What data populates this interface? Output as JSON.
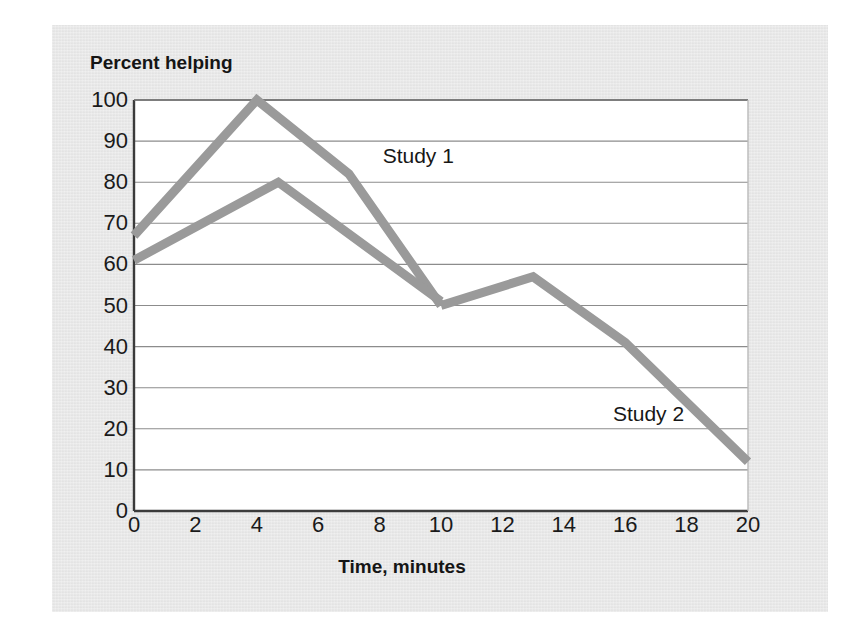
{
  "chart_data": {
    "type": "line",
    "title": "",
    "xlabel": "Time, minutes",
    "ylabel": "Percent helping",
    "xlim": [
      0,
      20
    ],
    "ylim": [
      0,
      100
    ],
    "xticks": [
      0,
      2,
      4,
      6,
      8,
      10,
      12,
      14,
      16,
      18,
      20
    ],
    "yticks": [
      0,
      10,
      20,
      30,
      40,
      50,
      60,
      70,
      80,
      90,
      100
    ],
    "grid": "horizontal",
    "legend_position": "inline-annotation",
    "line_color": "#9a9a9a",
    "line_width_px": 9,
    "series": [
      {
        "name": "Study 1",
        "label_x": 8.1,
        "label_y": 86,
        "x": [
          0,
          4,
          7,
          10
        ],
        "y": [
          67,
          100,
          82,
          50
        ]
      },
      {
        "name": "Study 2",
        "label_x": 15.6,
        "label_y": 23,
        "x": [
          0,
          4.7,
          10
        ],
        "y": [
          61,
          80,
          51
        ]
      },
      {
        "name": "Combined tail",
        "label_x": null,
        "label_y": null,
        "x": [
          10,
          13,
          16,
          20
        ],
        "y": [
          50,
          57,
          41,
          12
        ]
      }
    ]
  },
  "axes": {
    "y_title": "Percent helping",
    "x_title": "Time, minutes",
    "y_tick_labels": [
      "100",
      "90",
      "80",
      "70",
      "60",
      "50",
      "40",
      "30",
      "20",
      "10",
      "0"
    ],
    "x_tick_labels": [
      "0",
      "2",
      "4",
      "6",
      "8",
      "10",
      "12",
      "14",
      "16",
      "18",
      "20"
    ]
  },
  "annotations": [
    {
      "text": "Study 1"
    },
    {
      "text": "Study 2"
    }
  ],
  "colors": {
    "panel_background": "#e6e6e6",
    "plot_background": "#ffffff",
    "line": "#9a9a9a",
    "gridline": "#8c8c8c",
    "axis": "#3b3b3b",
    "text": "#1a1a1a"
  }
}
